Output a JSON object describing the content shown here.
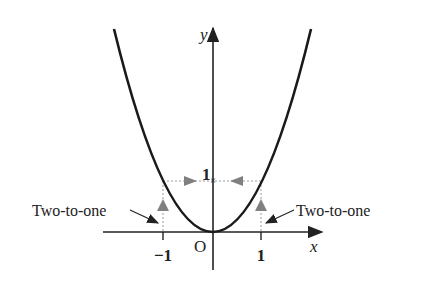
{
  "figure": {
    "function": "y = x^2",
    "axes": {
      "x_label": "x",
      "y_label": "y",
      "origin_label": "O"
    },
    "ticks": {
      "x_neg": "−1",
      "x_pos": "1",
      "y": "1"
    },
    "annotations": {
      "left": "Two-to-one",
      "right": "Two-to-one"
    },
    "colors": {
      "curve": "#1a1a1a",
      "axis": "#222222",
      "guide": "#9a9a9a",
      "marker": "#808080"
    }
  }
}
